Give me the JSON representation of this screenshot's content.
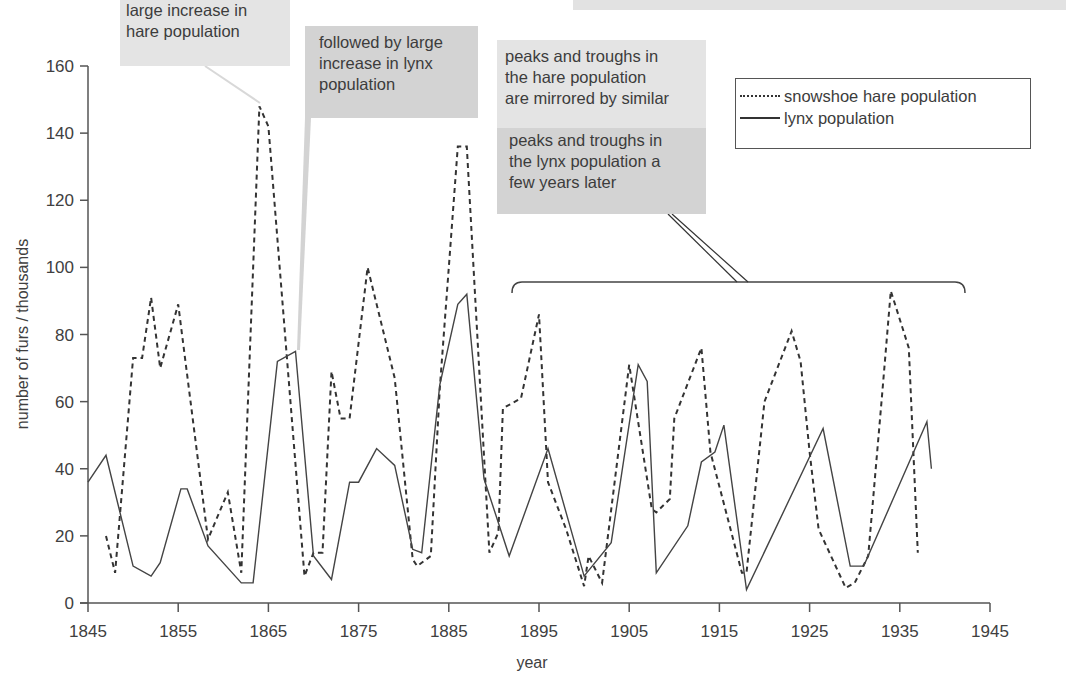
{
  "chart_data": {
    "type": "line",
    "title": "",
    "xlabel": "year",
    "ylabel": "number of furs / thousands",
    "xlim": [
      1845,
      1945
    ],
    "ylim": [
      0,
      160
    ],
    "x_ticks": [
      1845,
      1855,
      1865,
      1875,
      1885,
      1895,
      1905,
      1915,
      1925,
      1935,
      1945
    ],
    "y_ticks": [
      0,
      20,
      40,
      60,
      80,
      100,
      120,
      140,
      160
    ],
    "grid": false,
    "legend_position": "upper right",
    "series": [
      {
        "name": "snowshoe hare population",
        "style": "dashed",
        "points": [
          [
            1847,
            20
          ],
          [
            1848,
            9
          ],
          [
            1850,
            73
          ],
          [
            1851,
            73
          ],
          [
            1852,
            91
          ],
          [
            1853,
            70
          ],
          [
            1855,
            89
          ],
          [
            1858.3,
            19
          ],
          [
            1860.5,
            33
          ],
          [
            1862,
            9
          ],
          [
            1864,
            148
          ],
          [
            1865,
            142
          ],
          [
            1867,
            75
          ],
          [
            1869,
            8
          ],
          [
            1870,
            15
          ],
          [
            1871,
            15
          ],
          [
            1872,
            69
          ],
          [
            1873,
            55
          ],
          [
            1874,
            55
          ],
          [
            1876,
            100
          ],
          [
            1879,
            67
          ],
          [
            1881,
            13
          ],
          [
            1881.5,
            11
          ],
          [
            1883,
            14
          ],
          [
            1884,
            64
          ],
          [
            1886,
            136
          ],
          [
            1887,
            136
          ],
          [
            1889.5,
            15
          ],
          [
            1890.5,
            21
          ],
          [
            1891,
            58
          ],
          [
            1893,
            61
          ],
          [
            1895,
            86
          ],
          [
            1896,
            36
          ],
          [
            1898,
            22
          ],
          [
            1900,
            5
          ],
          [
            1900.5,
            14
          ],
          [
            1902,
            6
          ],
          [
            1905,
            71
          ],
          [
            1907.5,
            28
          ],
          [
            1908,
            27
          ],
          [
            1909.5,
            31
          ],
          [
            1910,
            55
          ],
          [
            1913,
            76
          ],
          [
            1914,
            45
          ],
          [
            1917.5,
            9
          ],
          [
            1918,
            9
          ],
          [
            1920,
            60
          ],
          [
            1923,
            81
          ],
          [
            1924,
            72
          ],
          [
            1925,
            45
          ],
          [
            1926,
            22
          ],
          [
            1929,
            4.5
          ],
          [
            1930,
            6
          ],
          [
            1931.5,
            14
          ],
          [
            1933,
            61
          ],
          [
            1934,
            93
          ],
          [
            1936,
            76
          ],
          [
            1937,
            15
          ]
        ]
      },
      {
        "name": "lynx population",
        "style": "solid",
        "points": [
          [
            1845,
            36
          ],
          [
            1847,
            44
          ],
          [
            1850,
            11
          ],
          [
            1852,
            8
          ],
          [
            1853,
            12
          ],
          [
            1855.3,
            34
          ],
          [
            1856,
            34
          ],
          [
            1858.3,
            17
          ],
          [
            1862,
            6
          ],
          [
            1863.3,
            6
          ],
          [
            1866,
            72
          ],
          [
            1868,
            75
          ],
          [
            1870,
            14
          ],
          [
            1872,
            7
          ],
          [
            1874,
            36
          ],
          [
            1875,
            36
          ],
          [
            1877,
            46
          ],
          [
            1879,
            41
          ],
          [
            1881,
            16
          ],
          [
            1882,
            15
          ],
          [
            1884,
            65
          ],
          [
            1886,
            89
          ],
          [
            1887,
            92
          ],
          [
            1888.9,
            37
          ],
          [
            1891.7,
            14
          ],
          [
            1896,
            46
          ],
          [
            1900,
            8
          ],
          [
            1903,
            18
          ],
          [
            1906,
            71
          ],
          [
            1907,
            66
          ],
          [
            1908,
            9
          ],
          [
            1911.5,
            23
          ],
          [
            1913,
            42
          ],
          [
            1914.5,
            45
          ],
          [
            1915.5,
            53
          ],
          [
            1918,
            4
          ],
          [
            1926.5,
            52
          ],
          [
            1929.5,
            11
          ],
          [
            1931,
            11
          ],
          [
            1938,
            54
          ],
          [
            1938.5,
            40
          ]
        ]
      }
    ],
    "annotations": [
      {
        "text": "large increase in hare population",
        "target": [
          1864,
          148
        ]
      },
      {
        "text": "followed by large increase in lynx population",
        "target": [
          1868,
          75
        ]
      },
      {
        "text": "peaks and troughs in the hare population are mirrored by similar peaks and troughs in the lynx population a few years later",
        "target_range": [
          1892,
          1942
        ]
      }
    ]
  },
  "annotations": {
    "hare_increase": [
      "large increase in",
      "hare population"
    ],
    "lynx_increase": [
      "followed by large",
      "increase in lynx",
      "population"
    ],
    "mirror_part1": [
      "peaks and troughs in",
      "the hare population",
      "are mirrored by similar"
    ],
    "mirror_part2": [
      "peaks and troughs in",
      "the lynx population a",
      "few years later"
    ]
  },
  "legend": {
    "hare_label": "snowshoe hare population",
    "lynx_label": "lynx population"
  },
  "axes": {
    "xlabel": "year",
    "ylabel": "number of furs / thousands"
  },
  "colors": {
    "line": "#333333",
    "axis": "#555555",
    "note_light": "#e4e4e4",
    "note_dark": "#d3d3d3"
  }
}
